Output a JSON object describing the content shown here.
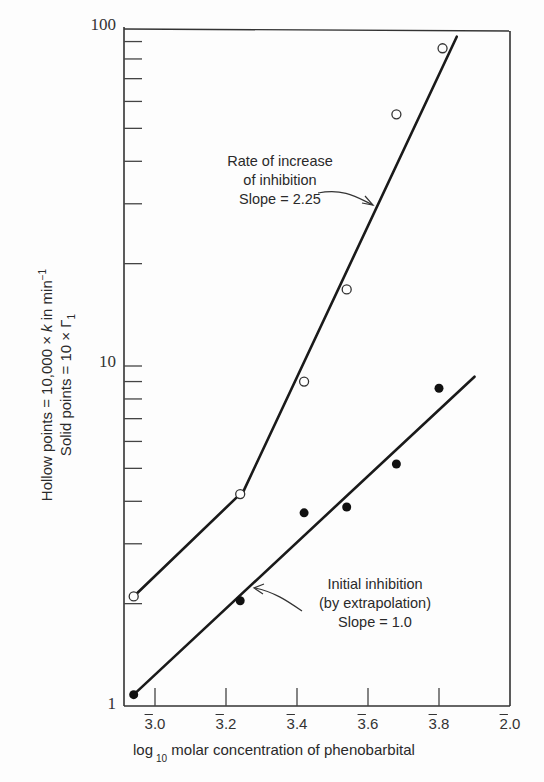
{
  "chart_data": {
    "type": "scatter",
    "title": "",
    "xlabel": "log 10 molar concentration of phenobarbital",
    "xlabel_parts": {
      "pre": "log",
      "sub": "10",
      "post": " molar concentration of phenobarbital"
    },
    "ylabel": "Hollow points = 10,000 × k in min⁻¹ / Solid points = 10 × Γ1",
    "ylabel_lines": {
      "line1_pre": "Hollow points = 10,000 × ",
      "line1_k": "k",
      "line1_post": " in min",
      "line1_sup": "−1",
      "line2_pre": "Solid points = 10 × Γ",
      "line2_sub": "1"
    },
    "yscale": "log",
    "ylim": [
      1,
      100
    ],
    "xlim": [
      2.94,
      4.0
    ],
    "x_ticks": [
      {
        "value": 3.0,
        "bar": "3",
        "rest": ".0"
      },
      {
        "value": 3.2,
        "bar": "3",
        "rest": ".2"
      },
      {
        "value": 3.4,
        "bar": "3",
        "rest": ".4"
      },
      {
        "value": 3.6,
        "bar": "3",
        "rest": ".6"
      },
      {
        "value": 3.8,
        "bar": "3",
        "rest": ".8"
      },
      {
        "value": 4.0,
        "bar": "2",
        "rest": ".0"
      }
    ],
    "y_tick_labels": [
      "1",
      "10",
      "100"
    ],
    "grid": false,
    "series": [
      {
        "name": "Rate of increase of inhibition (hollow points)",
        "marker": "hollow-circle",
        "x": [
          2.94,
          3.24,
          3.42,
          3.54,
          3.68,
          3.81
        ],
        "y": [
          2.1,
          4.2,
          9.0,
          16.8,
          55,
          86
        ]
      },
      {
        "name": "Initial inhibition (solid points)",
        "marker": "solid-circle",
        "x": [
          2.94,
          3.24,
          3.42,
          3.54,
          3.68,
          3.8
        ],
        "y": [
          1.08,
          2.04,
          3.7,
          3.85,
          5.15,
          8.6
        ]
      }
    ],
    "fit_lines": [
      {
        "name": "upper-line-low-segment",
        "points": [
          [
            2.94,
            2.1
          ],
          [
            3.25,
            4.3
          ]
        ]
      },
      {
        "name": "upper-line-steep-segment",
        "slope": 2.25,
        "points": [
          [
            3.25,
            4.3
          ],
          [
            3.85,
            93
          ]
        ]
      },
      {
        "name": "lower-line",
        "slope": 1.0,
        "points": [
          [
            2.94,
            1.08
          ],
          [
            3.9,
            9.3
          ]
        ]
      }
    ],
    "annotations": [
      {
        "lines": [
          "Rate of increase",
          "of inhibition",
          "Slope = 2.25"
        ]
      },
      {
        "lines": [
          "Initial inhibition",
          "(by extrapolation)",
          "Slope = 1.0"
        ]
      }
    ]
  }
}
